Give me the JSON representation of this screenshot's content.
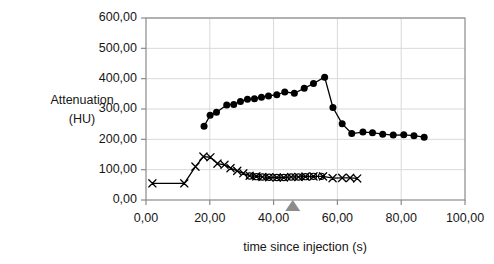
{
  "chart_data": {
    "type": "line",
    "title": "",
    "xlabel": "time since injection (s)",
    "ylabel": "Attenuation (HU)",
    "ylabel_line1": "Attenuation",
    "ylabel_line2": "(HU)",
    "xlim": [
      0,
      100
    ],
    "ylim": [
      0,
      600
    ],
    "xticks": [
      0,
      20,
      40,
      60,
      80,
      100
    ],
    "yticks": [
      0,
      100,
      200,
      300,
      400,
      500,
      600
    ],
    "xtick_labels": [
      "0,00",
      "20,00",
      "40,00",
      "60,00",
      "80,00",
      "100,00"
    ],
    "ytick_labels": [
      "0,00",
      "100,00",
      "200,00",
      "300,00",
      "400,00",
      "500,00",
      "600,00"
    ],
    "grid": "horizontal-and-vertical-light",
    "legend": "none",
    "decimal_separator": ",",
    "annotations": [
      {
        "name": "scan-start-marker",
        "shape": "triangle",
        "color": "#8c8c8c",
        "x": 46,
        "y": 0,
        "label": ""
      }
    ],
    "series": [
      {
        "name": "aorta-attenuation",
        "marker": "filled-circle",
        "color": "#000000",
        "points": [
          [
            18.2,
            243
          ],
          [
            20.1,
            279
          ],
          [
            22.1,
            289
          ],
          [
            25.3,
            313
          ],
          [
            27.5,
            315
          ],
          [
            29.6,
            325
          ],
          [
            31.8,
            332
          ],
          [
            34.0,
            334
          ],
          [
            36.2,
            339
          ],
          [
            38.4,
            343
          ],
          [
            41.0,
            347
          ],
          [
            43.5,
            356
          ],
          [
            46.5,
            352
          ],
          [
            49.6,
            368
          ],
          [
            52.5,
            384
          ],
          [
            56.0,
            405
          ],
          [
            58.6,
            305
          ],
          [
            61.5,
            251
          ],
          [
            64.5,
            219
          ],
          [
            68.0,
            224
          ],
          [
            71.0,
            222
          ],
          [
            74.2,
            217
          ],
          [
            77.5,
            214
          ],
          [
            80.8,
            215
          ],
          [
            84.0,
            212
          ],
          [
            87.2,
            207
          ]
        ]
      },
      {
        "name": "vein-attenuation-x",
        "marker": "cross",
        "color": "#000000",
        "points": [
          [
            2.0,
            55
          ],
          [
            12.0,
            55
          ],
          [
            15.5,
            110
          ],
          [
            18.0,
            143
          ],
          [
            20.2,
            141
          ],
          [
            22.4,
            120
          ],
          [
            24.6,
            116
          ],
          [
            26.5,
            105
          ],
          [
            28.6,
            96
          ],
          [
            30.5,
            88
          ],
          [
            32.5,
            80
          ],
          [
            34.6,
            78
          ],
          [
            36.5,
            76
          ],
          [
            38.6,
            75
          ],
          [
            41.0,
            74
          ],
          [
            43.2,
            74
          ],
          [
            45.5,
            76
          ],
          [
            47.8,
            76
          ],
          [
            50.0,
            77
          ],
          [
            52.5,
            78
          ],
          [
            55.5,
            78
          ],
          [
            58.5,
            72
          ],
          [
            61.5,
            73
          ],
          [
            64.0,
            73
          ],
          [
            66.2,
            71
          ]
        ]
      },
      {
        "name": "muscle-attenuation-open-circle",
        "marker": "open-circle",
        "color": "#000000",
        "points": [
          [
            32.5,
            79
          ],
          [
            34.6,
            77
          ],
          [
            36.5,
            76
          ],
          [
            38.6,
            75
          ],
          [
            41.0,
            74
          ],
          [
            43.2,
            74
          ],
          [
            45.5,
            76
          ],
          [
            47.8,
            76
          ],
          [
            50.0,
            77
          ],
          [
            52.5,
            78
          ],
          [
            55.0,
            78
          ]
        ]
      }
    ]
  },
  "axes": {
    "plot_bg": "#ffffff",
    "border_color": "#808080",
    "grid_color": "#d9d9d9"
  }
}
